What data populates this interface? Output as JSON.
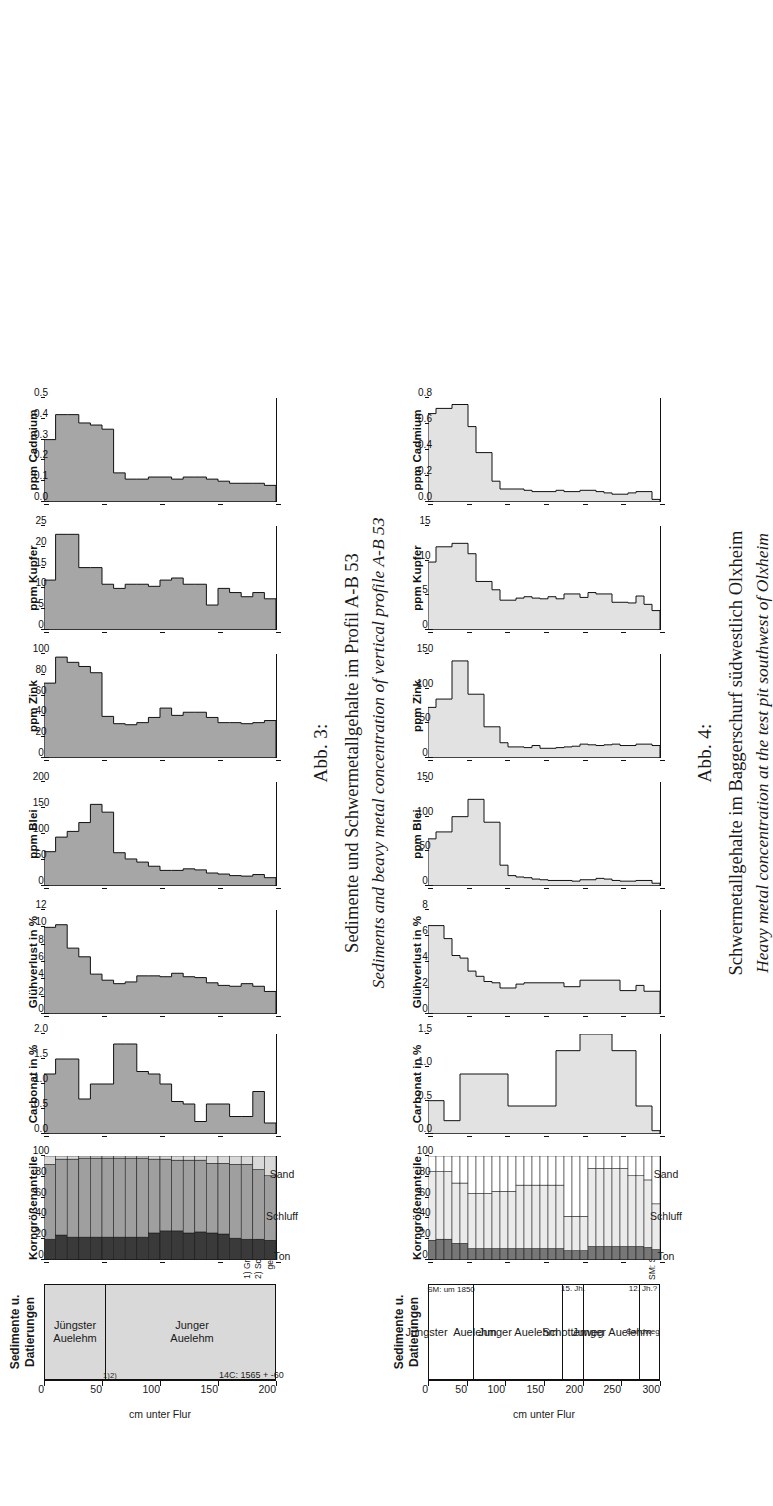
{
  "figures": [
    {
      "id": "abb3",
      "number": "Abb. 3:",
      "caption_de": "Sedimente und Schwermetallgehalte im Profil A-B 53",
      "caption_en": "Sediments and beavy metal concentration of vertical profile A-B 53",
      "depth_axis": {
        "label": "cm unter Flur",
        "ticks": [
          0,
          50,
          100,
          150,
          200
        ],
        "max": 200
      },
      "sediment_panel": {
        "title": "Sedimente u.\nDatierungen",
        "title_line1": "Sedimente u.",
        "title_line2": "Datierungen",
        "units": [
          {
            "name": "Jüngster\nAuelehm",
            "line1": "Jüngster",
            "line2": "Auelehm",
            "from": 0,
            "to": 52
          },
          {
            "name": "Junger\nAuelehm",
            "line1": "Junger",
            "line2": "Auelehm",
            "from": 52,
            "to": 200
          }
        ],
        "markers": [
          {
            "text": "1)",
            "depth": 50
          },
          {
            "text": "2)",
            "depth": 56
          },
          {
            "text": "14C: 1565 + -60",
            "depth": 150
          }
        ],
        "footnotes": [
          "1) Grenzstein: 1869",
          "2) Schwermetall-",
          "    gehalt: um 1850"
        ]
      },
      "grain_panel": {
        "title": "Korngrößenanteile",
        "ticks": [
          0,
          20,
          40,
          60,
          80,
          100
        ],
        "legend": [
          "Ton",
          "Schluff",
          "Sand"
        ],
        "colors": {
          "ton": "#3a3a3a",
          "schluff": "#9f9f9f",
          "sand": "#d9d9d9"
        }
      },
      "chart_data": {
        "type": "area",
        "title": "Sedimente und Schwermetallgehalte im Profil A-B 53",
        "ylabel": "cm unter Flur",
        "ylim": [
          0,
          200
        ],
        "orientation": "depth-vertical",
        "depth_bins": [
          0,
          10,
          20,
          30,
          40,
          50,
          60,
          70,
          80,
          90,
          100,
          110,
          120,
          130,
          140,
          150,
          160,
          170,
          180,
          190,
          200
        ],
        "panels": [
          {
            "name": "Korngrößenanteile",
            "type": "stacked-bar",
            "xlabel": "Korngrößenanteile",
            "xlim": [
              0,
              100
            ],
            "xticks": [
              0,
              20,
              40,
              60,
              80,
              100
            ],
            "series": [
              {
                "name": "Ton",
                "values": [
                  20,
                  24,
                  22,
                  22,
                  22,
                  22,
                  22,
                  22,
                  22,
                  26,
                  28,
                  28,
                  26,
                  27,
                  26,
                  25,
                  21,
                  20,
                  20,
                  19
                ]
              },
              {
                "name": "Schluff",
                "values": [
                  72,
                  73,
                  75,
                  76,
                  76,
                  76,
                  76,
                  76,
                  76,
                  71,
                  69,
                  68,
                  70,
                  69,
                  67,
                  68,
                  71,
                  72,
                  67,
                  62
                ]
              },
              {
                "name": "Sand",
                "values": [
                  8,
                  3,
                  3,
                  2,
                  2,
                  2,
                  2,
                  2,
                  2,
                  3,
                  3,
                  4,
                  4,
                  4,
                  7,
                  7,
                  8,
                  8,
                  13,
                  19
                ]
              }
            ]
          },
          {
            "name": "Carbonat in %",
            "type": "step-area",
            "xlabel": "Carbonat in %",
            "xlim": [
              0,
              2.0
            ],
            "xticks": [
              0.0,
              0.5,
              1.0,
              1.5,
              2.0
            ],
            "values": [
              1.2,
              1.5,
              1.5,
              0.7,
              1.0,
              1.0,
              1.8,
              1.8,
              1.25,
              1.2,
              1.0,
              0.65,
              0.6,
              0.25,
              0.6,
              0.6,
              0.35,
              0.35,
              0.85,
              0.22
            ]
          },
          {
            "name": "Glühverlust in %",
            "type": "step-area",
            "xlabel": "Glühverlust in %",
            "xlim": [
              0,
              12
            ],
            "xticks": [
              0,
              2,
              4,
              6,
              8,
              10,
              12
            ],
            "values": [
              10.0,
              10.3,
              7.6,
              6.6,
              4.6,
              3.9,
              3.5,
              3.7,
              4.4,
              4.4,
              4.3,
              4.7,
              4.3,
              4.2,
              3.6,
              3.3,
              3.2,
              3.5,
              3.2,
              2.6
            ]
          },
          {
            "name": "ppm Blei",
            "type": "step-area",
            "xlabel": "ppm Blei",
            "xlim": [
              0,
              200
            ],
            "xticks": [
              0,
              50,
              100,
              150,
              200
            ],
            "values": [
              66,
              94,
              105,
              122,
              157,
              142,
              64,
              52,
              46,
              38,
              30,
              30,
              33,
              31,
              25,
              23,
              20,
              19,
              22,
              16
            ]
          },
          {
            "name": "ppm Zink",
            "type": "step-area",
            "xlabel": "ppm Zink",
            "xlim": [
              0,
              100
            ],
            "xticks": [
              0,
              20,
              40,
              60,
              80,
              100
            ],
            "values": [
              72,
              97,
              92,
              88,
              82,
              40,
              33,
              32,
              34,
              39,
              48,
              41,
              44,
              44,
              39,
              34,
              34,
              33,
              34,
              36
            ]
          },
          {
            "name": "ppm Kupfer",
            "type": "step-area",
            "xlabel": "ppm Kupfer",
            "xlim": [
              0,
              25
            ],
            "xticks": [
              0,
              5,
              10,
              15,
              20,
              25
            ],
            "values": [
              12,
              23,
              23,
              15,
              15,
              11,
              10,
              11,
              11,
              10.5,
              12,
              12.5,
              11,
              11,
              6,
              10,
              9,
              8,
              9,
              7.5
            ]
          },
          {
            "name": "ppm Cadmium",
            "type": "step-area",
            "xlabel": "ppm Cadmium",
            "xlim": [
              0,
              0.5
            ],
            "xticks": [
              0.0,
              0.1,
              0.2,
              0.3,
              0.4,
              0.5
            ],
            "values": [
              0.3,
              0.42,
              0.42,
              0.38,
              0.37,
              0.35,
              0.14,
              0.11,
              0.11,
              0.12,
              0.12,
              0.11,
              0.12,
              0.12,
              0.11,
              0.1,
              0.09,
              0.09,
              0.09,
              0.08
            ]
          }
        ]
      }
    },
    {
      "id": "abb4",
      "number": "Abb. 4:",
      "caption_de": "Schwermetallgehalte im Baggerschurf südwestlich Olxheim",
      "caption_en": "Heavy metal concentration at the test pit southwest of Olxheim",
      "depth_axis": {
        "label": "cm unter Flur",
        "ticks": [
          0,
          50,
          100,
          150,
          200,
          250,
          300
        ],
        "max": 300
      },
      "sediment_panel": {
        "title_line1": "Sedimente u.",
        "title_line2": "Datierungen",
        "units": [
          {
            "name": "Jüngster  Auelehm",
            "from": 0,
            "to": 57,
            "note": "SM: um 1850"
          },
          {
            "name": "Junger Auelehm",
            "from": 57,
            "to": 172,
            "note": ""
          },
          {
            "name": "Schotterweg",
            "from": 172,
            "to": 199,
            "note": "15. Jh."
          },
          {
            "name": "Junger Auelehm",
            "from": 199,
            "to": 272,
            "note": ""
          },
          {
            "name": "Sandweg",
            "from": 272,
            "to": 280,
            "note": "12. Jh.?"
          }
        ],
        "legend_note": "SM: Schwermetallgehalt"
      },
      "grain_panel": {
        "title": "Korngrößenanteile",
        "ticks": [
          0,
          20,
          40,
          60,
          80,
          100
        ],
        "legend": [
          "Ton",
          "Schluff",
          "Sand"
        ],
        "colors": {
          "ton": "#777777",
          "schluff": "#ebebeb",
          "sand": "#ffffff"
        }
      },
      "chart_data": {
        "type": "area",
        "title": "Schwermetallgehalte im Baggerschurf südwestlich Olxheim",
        "ylabel": "cm unter Flur",
        "ylim": [
          0,
          300
        ],
        "orientation": "depth-vertical",
        "depth_bins": [
          0,
          10,
          20,
          30,
          40,
          50,
          60,
          70,
          80,
          90,
          100,
          110,
          120,
          130,
          140,
          150,
          160,
          170,
          180,
          190,
          200,
          210,
          220,
          230,
          240,
          250,
          260,
          270,
          280
        ],
        "panels": [
          {
            "name": "Korngrößenanteile",
            "type": "stacked-bar",
            "xlabel": "Korngrößenanteile",
            "xlim": [
              0,
              100
            ],
            "xticks": [
              0,
              20,
              40,
              60,
              80,
              100
            ],
            "series": [
              {
                "name": "Ton",
                "values": [
                  19,
                  20,
                  20,
                  16,
                  16,
                  11,
                  11,
                  11,
                  11,
                  11,
                  11,
                  11,
                  11,
                  11,
                  11,
                  11,
                  11,
                  9,
                  9,
                  9,
                  13,
                  13,
                  13,
                  13,
                  13,
                  13,
                  13,
                  12,
                  10
                ]
              },
              {
                "name": "Schluff",
                "values": [
                  66,
                  65,
                  65,
                  58,
                  58,
                  53,
                  53,
                  53,
                  55,
                  55,
                  55,
                  61,
                  61,
                  61,
                  61,
                  61,
                  61,
                  33,
                  33,
                  33,
                  75,
                  75,
                  75,
                  75,
                  75,
                  68,
                  68,
                  65,
                  44
                ]
              },
              {
                "name": "Sand",
                "values": [
                  15,
                  15,
                  15,
                  26,
                  26,
                  36,
                  36,
                  36,
                  34,
                  34,
                  34,
                  28,
                  28,
                  28,
                  28,
                  28,
                  28,
                  58,
                  58,
                  58,
                  12,
                  12,
                  12,
                  12,
                  12,
                  19,
                  19,
                  23,
                  46
                ]
              }
            ]
          },
          {
            "name": "Carbonat in %",
            "type": "step-area",
            "xlabel": "Carbonat in %",
            "xlim": [
              0,
              1.5
            ],
            "xticks": [
              0.0,
              0.5,
              1.0,
              1.5
            ],
            "values": [
              0.5,
              0.5,
              0.2,
              0.2,
              0.9,
              0.9,
              0.9,
              0.9,
              0.9,
              0.9,
              0.42,
              0.42,
              0.42,
              0.42,
              0.42,
              0.42,
              1.25,
              1.25,
              1.25,
              1.5,
              1.5,
              1.5,
              1.5,
              1.25,
              1.25,
              1.25,
              0.42,
              0.42,
              0.05
            ]
          },
          {
            "name": "Glühverlust in %",
            "type": "step-area",
            "xlabel": "Glühverlust in %",
            "xlim": [
              0,
              8
            ],
            "xticks": [
              0,
              2,
              4,
              6,
              8
            ],
            "values": [
              6.8,
              6.8,
              5.8,
              4.5,
              4.3,
              3.3,
              2.9,
              2.5,
              2.4,
              2.0,
              2.0,
              2.3,
              2.4,
              2.4,
              2.4,
              2.4,
              2.4,
              2.1,
              2.1,
              2.6,
              2.6,
              2.6,
              2.6,
              2.6,
              1.8,
              1.8,
              2.2,
              1.75,
              1.75
            ]
          },
          {
            "name": "ppm Blei",
            "type": "step-area",
            "xlabel": "ppm Blei",
            "xlim": [
              0,
              150
            ],
            "xticks": [
              0,
              50,
              100,
              150
            ],
            "values": [
              68,
              78,
              78,
              100,
              100,
              125,
              125,
              92,
              92,
              30,
              15,
              13,
              12,
              10,
              9,
              8,
              8,
              8,
              7,
              9,
              9,
              11,
              10,
              8,
              7,
              7,
              8,
              8,
              4
            ]
          },
          {
            "name": "ppm Zink",
            "type": "step-area",
            "xlabel": "ppm Zink",
            "xlim": [
              0,
              150
            ],
            "xticks": [
              0,
              50,
              100,
              150
            ],
            "values": [
              73,
              85,
              85,
              140,
              140,
              92,
              92,
              45,
              45,
              22,
              16,
              16,
              15,
              18,
              14,
              14,
              15,
              16,
              17,
              20,
              19,
              18,
              19,
              20,
              18,
              18,
              20,
              20,
              18
            ]
          },
          {
            "name": "ppm Kupfer",
            "type": "step-area",
            "xlabel": "ppm Kupfer",
            "xlim": [
              0,
              15
            ],
            "xticks": [
              0,
              5,
              10,
              15
            ],
            "values": [
              9.8,
              12,
              12,
              12.5,
              12.5,
              11,
              7,
              7,
              5.8,
              4.3,
              4.3,
              4.6,
              4.8,
              4.6,
              4.5,
              4.8,
              4.5,
              5.2,
              5.2,
              4.7,
              5.4,
              5.2,
              5.2,
              4.0,
              4.0,
              3.9,
              4.9,
              3.7,
              2.8
            ]
          },
          {
            "name": "ppm Cadmium",
            "type": "step-area",
            "xlabel": "ppm Cadmium",
            "xlim": [
              0,
              0.8
            ],
            "xticks": [
              0.0,
              0.2,
              0.4,
              0.6,
              0.8
            ],
            "values": [
              0.68,
              0.72,
              0.72,
              0.75,
              0.75,
              0.58,
              0.38,
              0.38,
              0.16,
              0.1,
              0.1,
              0.1,
              0.09,
              0.08,
              0.08,
              0.08,
              0.09,
              0.08,
              0.08,
              0.09,
              0.09,
              0.08,
              0.07,
              0.06,
              0.06,
              0.07,
              0.08,
              0.08,
              0.02
            ]
          }
        ]
      }
    }
  ]
}
